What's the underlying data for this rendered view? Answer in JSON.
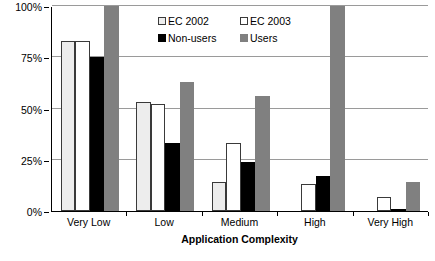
{
  "chart_data": {
    "type": "bar",
    "title": "",
    "xlabel": "Application Complexity",
    "ylabel": "Engagement",
    "categories": [
      "Very Low",
      "Low",
      "Medium",
      "High",
      "Very High"
    ],
    "ylim": [
      0,
      100
    ],
    "yticks": [
      0,
      25,
      50,
      75,
      100
    ],
    "ytick_labels": [
      "0%",
      "25%",
      "50%",
      "75%",
      "100%"
    ],
    "grid": true,
    "legend_position": "top-center",
    "series": [
      {
        "name": "EC 2002",
        "color": "#ededed",
        "edge": "#3a3a3a",
        "values": [
          83,
          53,
          14,
          0,
          0
        ]
      },
      {
        "name": "EC 2003",
        "color": "#ffffff",
        "edge": "#3a3a3a",
        "values": [
          83,
          52,
          33,
          13,
          7
        ]
      },
      {
        "name": "Non-users",
        "color": "#000000",
        "edge": "#000000",
        "values": [
          75,
          33,
          24,
          17,
          1
        ]
      },
      {
        "name": "Users",
        "color": "#808080",
        "edge": "#808080",
        "values": [
          100,
          63,
          56,
          100,
          14
        ]
      }
    ]
  }
}
